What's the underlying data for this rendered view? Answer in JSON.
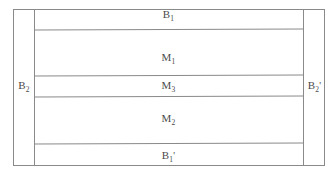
{
  "diagram": {
    "type": "layered-block-structure",
    "line_color": "#8a8a8a",
    "text_color": "#4a4a4a",
    "background_color": "#ffffff",
    "core_bands": [
      {
        "id": "band-b1",
        "base": "B",
        "subscript": "1",
        "prime": "",
        "label": "B1"
      },
      {
        "id": "band-m1",
        "base": "M",
        "subscript": "1",
        "prime": "",
        "label": "M1"
      },
      {
        "id": "band-m3",
        "base": "M",
        "subscript": "3",
        "prime": "",
        "label": "M3"
      },
      {
        "id": "band-m2",
        "base": "M",
        "subscript": "2",
        "prime": "",
        "label": "M2"
      },
      {
        "id": "band-b1p",
        "base": "B",
        "subscript": "1",
        "prime": "'",
        "label": "B1'"
      }
    ],
    "side_columns": [
      {
        "id": "col-left",
        "base": "B",
        "subscript": "2",
        "prime": "",
        "label": "B2"
      },
      {
        "id": "col-right",
        "base": "B",
        "subscript": "2",
        "prime": "'",
        "label": "B2'"
      }
    ]
  }
}
